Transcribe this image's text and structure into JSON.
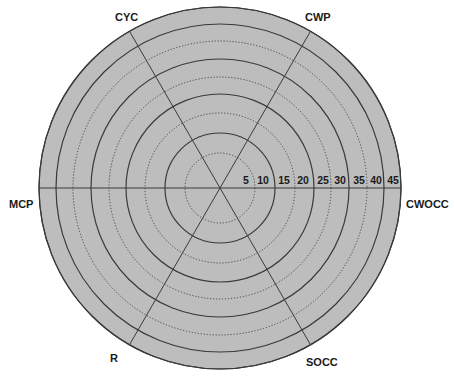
{
  "chart_data": {
    "type": "radar",
    "title": "",
    "center": {
      "x": 220,
      "y": 188
    },
    "axes": [
      {
        "name": "CWOCC",
        "angle_deg": 0
      },
      {
        "name": "CWP",
        "angle_deg": 60
      },
      {
        "name": "CYC",
        "angle_deg": 120
      },
      {
        "name": "MCP",
        "angle_deg": 180
      },
      {
        "name": "R",
        "angle_deg": 240
      },
      {
        "name": "SOCC",
        "angle_deg": 300
      }
    ],
    "rings": [
      {
        "value": 5,
        "radius": 35,
        "style": "dotted"
      },
      {
        "value": 10,
        "radius": 55,
        "style": "solid"
      },
      {
        "value": 15,
        "radius": 75,
        "style": "dotted"
      },
      {
        "value": 20,
        "radius": 94,
        "style": "solid"
      },
      {
        "value": 25,
        "radius": 111,
        "style": "dotted"
      },
      {
        "value": 30,
        "radius": 129,
        "style": "solid"
      },
      {
        "value": 35,
        "radius": 147,
        "style": "dotted"
      },
      {
        "value": 40,
        "radius": 164,
        "style": "solid"
      },
      {
        "value": 45,
        "radius": 181,
        "style": "solid"
      }
    ],
    "tick_labels": [
      "5",
      "10",
      "15",
      "20",
      "25",
      "30",
      "35",
      "40",
      "45"
    ],
    "tick_label_positions_x": [
      246,
      263,
      284,
      303,
      323,
      340,
      359,
      376,
      393
    ],
    "series": [],
    "colors": {
      "fill": "#bdbdbd",
      "line": "#3a3a3a",
      "text": "#1a1a1a"
    }
  },
  "labels": {
    "cyc": "CYC",
    "cwp": "CWP",
    "mcp": "MCP",
    "cwocc": "CWOCC",
    "r": "R",
    "socc": "SOCC"
  }
}
